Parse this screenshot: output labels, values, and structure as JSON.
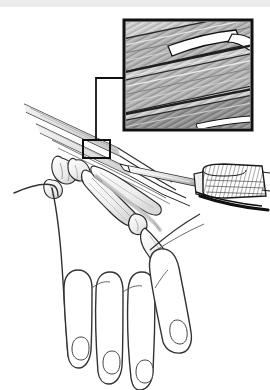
{
  "figure": {
    "caption": "",
    "view": "dorsal view of right hand with magnified tendon inset",
    "style": "black and white medical line illustration with grayscale halftone inset",
    "canvas": {
      "width": 270,
      "height": 390,
      "background": "#ffffff"
    },
    "top_band": {
      "present": true,
      "color": "#ececec",
      "height": 7
    }
  },
  "colors": {
    "ink": "#1a1a1a",
    "outline": "#2b2b2b",
    "thin_line": "#444444",
    "inset_frame": "#111111",
    "inset_fill_light": "#d9d9d9",
    "inset_fill_mid": "#b4b4b4",
    "inset_fill_dark": "#8c8c8c",
    "inset_fill_darker": "#6e6e6e",
    "tendon_shade": "#cfcfcf",
    "bone_shade": "#e2e2e2",
    "metal_shade": "#c8c8c8",
    "white": "#ffffff",
    "band": "#ececec"
  },
  "inset": {
    "name": "magnified-tendon-inset",
    "x": 124,
    "y": 20,
    "width": 128,
    "height": 110,
    "frame_width": 3,
    "content": "longitudinal tendon fibers running diagonally with a white wedge-shaped split/incision in the upper fiber bundle",
    "fiber_count": 26,
    "label": ""
  },
  "leader": {
    "name": "leader-line",
    "from_box": {
      "x": 83,
      "y": 140,
      "width": 27,
      "height": 18
    },
    "path": "from callout box up-left then up and right to inset left edge",
    "stroke_width": 2
  },
  "hand": {
    "name": "hand-illustration",
    "fingers": [
      {
        "id": "index",
        "nail": true
      },
      {
        "id": "middle",
        "nail": true
      },
      {
        "id": "ring",
        "nail": true
      },
      {
        "id": "little",
        "nail": true
      }
    ],
    "skeleton_visible": true,
    "bones": [
      "carpals",
      "metacarpal",
      "proximal phalanx",
      "middle phalanx",
      "distal phalanx"
    ],
    "tendons_visible": true
  },
  "instrument": {
    "name": "syringe-needle",
    "parts": [
      "needle shaft",
      "needle hub",
      "hatched barrel"
    ],
    "entry_side": "right",
    "barrel": {
      "x": 196,
      "y": 168,
      "width": 72,
      "height": 30
    }
  },
  "annotations": []
}
